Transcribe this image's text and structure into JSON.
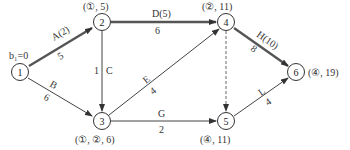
{
  "diagram": {
    "type": "network-diagram",
    "start_label": "b₁=0",
    "nodes": [
      {
        "id": "1",
        "x": 20,
        "y": 72,
        "annotation": ""
      },
      {
        "id": "2",
        "x": 102,
        "y": 22,
        "annotation": "(①, 5)"
      },
      {
        "id": "3",
        "x": 102,
        "y": 121,
        "annotation": "(①, ②, 6)"
      },
      {
        "id": "4",
        "x": 226,
        "y": 22,
        "annotation": "(②, 11)"
      },
      {
        "id": "5",
        "x": 226,
        "y": 121,
        "annotation": "(④, 11)"
      },
      {
        "id": "6",
        "x": 296,
        "y": 72,
        "annotation": "(④, 19)"
      }
    ],
    "edges": [
      {
        "from": "1",
        "to": "2",
        "name": "A(2)",
        "weight": "5",
        "bold": true,
        "dashed": false
      },
      {
        "from": "1",
        "to": "3",
        "name": "B",
        "weight": "6",
        "bold": false,
        "dashed": false
      },
      {
        "from": "2",
        "to": "3",
        "name": "C",
        "weight": "1",
        "bold": false,
        "dashed": false
      },
      {
        "from": "2",
        "to": "4",
        "name": "D(5)",
        "weight": "6",
        "bold": true,
        "dashed": false
      },
      {
        "from": "3",
        "to": "4",
        "name": "E",
        "weight": "4",
        "bold": false,
        "dashed": false
      },
      {
        "from": "3",
        "to": "5",
        "name": "G",
        "weight": "2",
        "bold": false,
        "dashed": false
      },
      {
        "from": "4",
        "to": "5",
        "name": "",
        "weight": "",
        "bold": false,
        "dashed": true
      },
      {
        "from": "4",
        "to": "6",
        "name": "H(10)",
        "weight": "8",
        "bold": true,
        "dashed": false
      },
      {
        "from": "5",
        "to": "6",
        "name": "L",
        "weight": "4",
        "bold": false,
        "dashed": false
      }
    ]
  },
  "colors": {
    "bold_edge": "#555555",
    "thin_edge": "#444444",
    "node_stroke": "#333333",
    "dashed_edge": "#666666"
  }
}
